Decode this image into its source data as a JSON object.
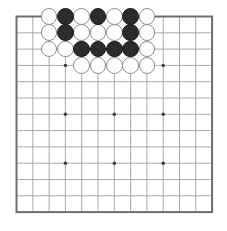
{
  "board": {
    "name": "go-board",
    "size": 13,
    "origin_x": 16.5,
    "origin_y": 16.5,
    "spacing": 16.3,
    "line_color": "#9a9a9a",
    "border_color": "#6e6e6e",
    "background_color": "#ffffff",
    "star_point_color": "#3a3a3a",
    "star_points": [
      [
        3,
        3
      ],
      [
        3,
        6
      ],
      [
        3,
        9
      ],
      [
        6,
        3
      ],
      [
        6,
        6
      ],
      [
        6,
        9
      ],
      [
        9,
        3
      ],
      [
        9,
        6
      ],
      [
        9,
        9
      ]
    ]
  },
  "stones": {
    "black_color": "#2c2c2c",
    "white_color": "#fdfdfd",
    "radius": 8.4,
    "black": [
      [
        3,
        0
      ],
      [
        5,
        0
      ],
      [
        7,
        0
      ],
      [
        3,
        1
      ],
      [
        7,
        1
      ],
      [
        4,
        2
      ],
      [
        5,
        2
      ],
      [
        6,
        2
      ],
      [
        7,
        2
      ]
    ],
    "white": [
      [
        2,
        0
      ],
      [
        4,
        0
      ],
      [
        6,
        0
      ],
      [
        8,
        0
      ],
      [
        2,
        1
      ],
      [
        4,
        1
      ],
      [
        5,
        1
      ],
      [
        6,
        1
      ],
      [
        8,
        1
      ],
      [
        2,
        2
      ],
      [
        3,
        2
      ],
      [
        8,
        2
      ],
      [
        4,
        3
      ],
      [
        5,
        3
      ],
      [
        6,
        3
      ],
      [
        7,
        3
      ],
      [
        8,
        3
      ]
    ]
  },
  "labels": {
    "black_label": "Black stone",
    "white_label": "White stone",
    "star_label": "Star point (hoshi)"
  }
}
